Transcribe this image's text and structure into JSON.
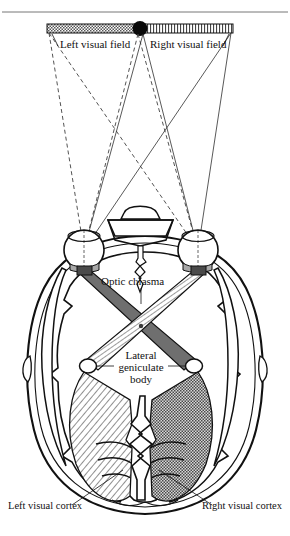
{
  "figure": {
    "top_rule": true,
    "labels": {
      "left_visual_field": "Left visual field",
      "right_visual_field": "Right visual field",
      "optic_chiasma": "Optic chiasma",
      "lateral_line1": "Lateral",
      "lateral_line2": "geniculate",
      "lateral_line3": "body",
      "left_visual_cortex": "Left visual cortex",
      "right_visual_cortex": "Right visual cortex"
    },
    "visual_field_bar": {
      "left_half_pattern": "gray-checker",
      "right_half_pattern": "white-vertical-hatch",
      "fixation_point": "black-dot",
      "x_start": 47,
      "x_end": 233,
      "y": 24,
      "height": 9,
      "center_x": 140
    },
    "rays": {
      "left_field_style": "dashed",
      "right_field_style": "solid",
      "left_field_color": "#4a4a4a",
      "right_field_color": "#3a3a3a"
    },
    "eyes": [
      {
        "name": "left-eye",
        "cx": 84,
        "cy": 250,
        "r": 20
      },
      {
        "name": "right-eye",
        "cx": 198,
        "cy": 250,
        "r": 20
      }
    ],
    "lateral_geniculate_bodies": [
      {
        "name": "left-lgb",
        "cx": 88,
        "cy": 366,
        "rx": 8,
        "ry": 7
      },
      {
        "name": "right-lgb",
        "cx": 194,
        "cy": 366,
        "rx": 8,
        "ry": 7
      }
    ],
    "chiasma_center": {
      "x": 141,
      "y": 326
    },
    "tract_patterns": {
      "crossed_dark": "#6b6b6b",
      "crossed_hatch": "white-diagonal-hatch"
    },
    "radiation_patterns": {
      "left": "white-diagonal-hatch",
      "right": "gray-checker"
    },
    "colors": {
      "ink": "#111111",
      "gray_fill": "#6f6f6f",
      "light_gray": "#9a9a9a",
      "rule": "#555555"
    }
  }
}
